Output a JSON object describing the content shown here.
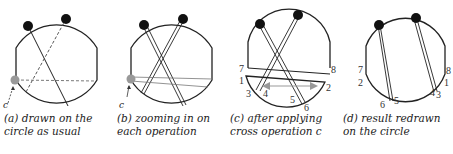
{
  "panels": [
    {
      "id": "a",
      "caption_line1": "(a) drawn on the",
      "caption_line2": "circle as usual",
      "marker_label": "c"
    },
    {
      "id": "b",
      "caption_line1": "(b) zooming in on",
      "caption_line2": "each operation",
      "marker_label": "c"
    },
    {
      "id": "c",
      "caption_line1": "(c) after applying",
      "caption_line2": "cross operation c",
      "labels": {
        "l1": "1",
        "l2": "2",
        "l3": "3",
        "l4": "4",
        "l5": "5",
        "l6": "6",
        "l7": "7",
        "l8": "8"
      }
    },
    {
      "id": "d",
      "caption_line1": "(d) result redrawn",
      "caption_line2": "on the circle",
      "labels": {
        "l1": "1",
        "l2": "2",
        "l3": "3",
        "l4": "4",
        "l5": "5",
        "l6": "6",
        "l7": "7",
        "l8": "8"
      }
    }
  ],
  "colors": {
    "stroke": "#222222",
    "node": "#111111",
    "cross_node": "#999999",
    "arrow": "#999999"
  }
}
